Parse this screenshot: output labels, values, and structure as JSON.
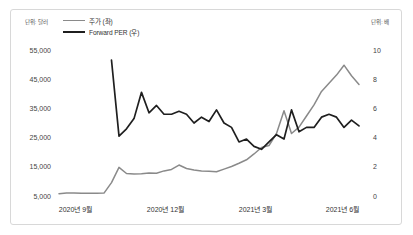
{
  "chart_data": {
    "type": "line",
    "title": "",
    "xlabel": "",
    "grid": false,
    "legend_position": "top-left",
    "unit_left": "단위: 달러",
    "unit_right": "단위: 배",
    "y_left": {
      "label": "주가",
      "ticks": [
        "55,000",
        "45,000",
        "35,000",
        "25,000",
        "15,000",
        "5,000"
      ],
      "tick_values": [
        55000,
        45000,
        35000,
        25000,
        15000,
        5000
      ],
      "ylim": [
        5000,
        55000
      ]
    },
    "y_right": {
      "label": "Forward PER",
      "ticks": [
        "10",
        "8",
        "6",
        "4",
        "2",
        "0"
      ],
      "tick_values": [
        10,
        8,
        6,
        4,
        2,
        0
      ],
      "ylim": [
        0,
        10
      ]
    },
    "x_ticks": [
      "2020년 9월",
      "2020년 12월",
      "2021년 3월",
      "2021년 6월"
    ],
    "x_tick_positions": [
      0.055,
      0.355,
      0.655,
      0.945
    ],
    "series": [
      {
        "name": "주가 (좌)",
        "axis": "left",
        "color": "#8a8a8a",
        "values": [
          5800,
          6000,
          6050,
          5950,
          5900,
          5950,
          6000,
          9600,
          14800,
          12700,
          12500,
          12600,
          12900,
          12800,
          13600,
          14100,
          15600,
          14400,
          13900,
          13600,
          13500,
          13300,
          14200,
          15100,
          16200,
          17400,
          19400,
          21600,
          22300,
          26400,
          34200,
          26400,
          28600,
          32400,
          36200,
          40800,
          43600,
          46400,
          49800,
          46200,
          43200
        ]
      },
      {
        "name": "Forward PER (우)",
        "axis": "right",
        "color": "#1f1f1f",
        "values": [
          null,
          null,
          null,
          null,
          null,
          null,
          null,
          9.3,
          4.1,
          4.6,
          5.3,
          7.1,
          5.7,
          6.2,
          5.6,
          5.6,
          5.8,
          5.6,
          5.0,
          5.4,
          5.1,
          5.9,
          5.0,
          4.7,
          3.7,
          3.9,
          3.4,
          3.2,
          3.7,
          4.2,
          3.9,
          5.9,
          4.4,
          4.7,
          4.7,
          5.4,
          5.6,
          5.4,
          4.7,
          5.2,
          4.8
        ]
      }
    ]
  },
  "legend": {
    "items": [
      {
        "label": "주가 (좌)",
        "color": "#8a8a8a"
      },
      {
        "label": "Forward PER (우)",
        "color": "#1f1f1f"
      }
    ]
  }
}
